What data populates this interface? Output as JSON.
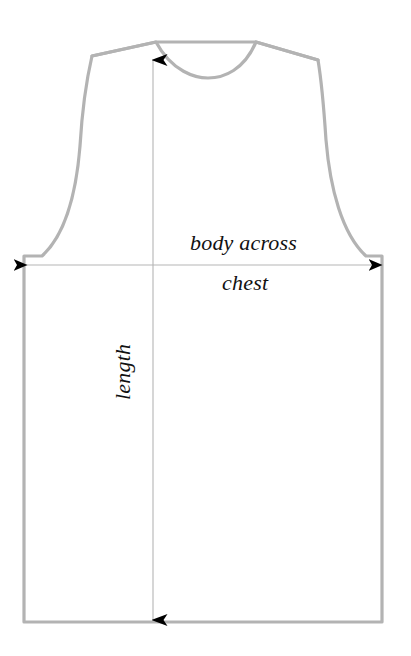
{
  "diagram": {
    "background_color": "#ffffff",
    "outline_color": "#b3b3b3",
    "outline_width": 3,
    "arrow_color": "#b0b0b0",
    "arrow_head_color": "#000000",
    "text_color": "#111111"
  },
  "labels": {
    "body_across": "body across",
    "chest": "chest",
    "length": "length"
  },
  "measurements": [
    {
      "name": "body across chest",
      "orientation": "horizontal",
      "label_lines": [
        "body across",
        "chest"
      ],
      "arrow_style": "double-headed",
      "start_x": 26,
      "end_x": 381,
      "y": 265
    },
    {
      "name": "length",
      "orientation": "vertical",
      "label_lines": [
        "length"
      ],
      "arrow_style": "double-headed",
      "x": 153,
      "start_y": 58,
      "end_y": 622
    }
  ],
  "outline": {
    "neck_left_x": 156,
    "neck_right_x": 256,
    "neck_top_y": 42,
    "neck_depth_y": 70,
    "shoulder_left_x": 92,
    "shoulder_left_y": 56,
    "shoulder_right_x": 318,
    "shoulder_right_y": 60,
    "side_left_x": 24,
    "side_right_x": 382,
    "hem_y": 622,
    "underarm_y": 258
  }
}
